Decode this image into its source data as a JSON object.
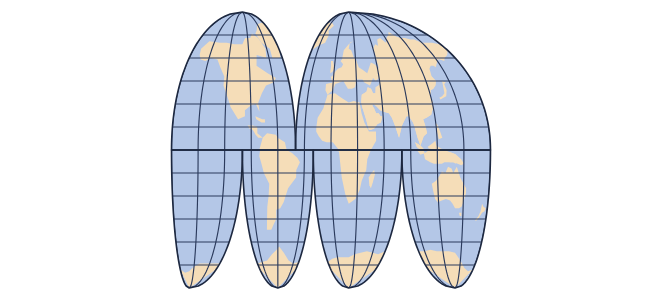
{
  "figure": {
    "type": "map",
    "projection": "interrupted-homolosine",
    "background_color": "#ffffff",
    "width": 662,
    "height": 299
  },
  "style": {
    "ocean_color": "#b4c7e7",
    "land_color": "#f5ddb8",
    "graticule_color": "#2b3a5c",
    "outline_color": "#1d2840",
    "graticule_width": 1.15,
    "outline_width": 1.6
  },
  "graticule": {
    "meridian_interval_deg": 30,
    "parallel_interval_deg": 15,
    "central_meridians": [
      -100,
      20,
      140
    ],
    "labels_visible": false
  },
  "lobes": [
    {
      "name": "north-americas-lobe",
      "hemisphere": "north",
      "central_meridian": -100,
      "lon_min": -180,
      "lon_max": -40,
      "lat_min": 0,
      "lat_max": 90
    },
    {
      "name": "north-eurasia-africa-lobe",
      "hemisphere": "north",
      "central_meridian": 20,
      "lon_min": -40,
      "lon_max": 180,
      "lat_min": 0,
      "lat_max": 90
    },
    {
      "name": "south-pacific-americas-lobe",
      "hemisphere": "south",
      "central_meridian": -160,
      "lon_min": -180,
      "lon_max": -100,
      "lat_min": -90,
      "lat_max": 0
    },
    {
      "name": "south-atlantic-americas-lobe",
      "hemisphere": "south",
      "central_meridian": -60,
      "lon_min": -100,
      "lon_max": -20,
      "lat_min": -90,
      "lat_max": 0
    },
    {
      "name": "south-africa-lobe",
      "hemisphere": "south",
      "central_meridian": 20,
      "lon_min": -20,
      "lon_max": 80,
      "lat_min": -90,
      "lat_max": 0
    },
    {
      "name": "south-australia-lobe",
      "hemisphere": "south",
      "central_meridian": 140,
      "lon_min": 80,
      "lon_max": 180,
      "lat_min": -90,
      "lat_max": 0
    }
  ],
  "landmasses": [
    {
      "name": "north-america",
      "lobe": "north-americas-lobe"
    },
    {
      "name": "greenland",
      "lobe": "north-americas-lobe"
    },
    {
      "name": "central-america",
      "lobe": "north-americas-lobe"
    },
    {
      "name": "caribbean",
      "lobe": "north-americas-lobe"
    },
    {
      "name": "south-america",
      "lobe": "south-atlantic-americas-lobe"
    },
    {
      "name": "africa",
      "lobe": "north-eurasia-africa-lobe"
    },
    {
      "name": "europe",
      "lobe": "north-eurasia-africa-lobe"
    },
    {
      "name": "asia",
      "lobe": "north-eurasia-africa-lobe"
    },
    {
      "name": "arabia",
      "lobe": "north-eurasia-africa-lobe"
    },
    {
      "name": "india",
      "lobe": "north-eurasia-africa-lobe"
    },
    {
      "name": "southeast-asia",
      "lobe": "north-eurasia-africa-lobe"
    },
    {
      "name": "indonesia",
      "lobe": "south-australia-lobe"
    },
    {
      "name": "australia",
      "lobe": "south-australia-lobe"
    },
    {
      "name": "new-zealand",
      "lobe": "south-australia-lobe"
    },
    {
      "name": "madagascar",
      "lobe": "south-africa-lobe"
    },
    {
      "name": "antarctica-pacific",
      "lobe": "south-pacific-americas-lobe"
    },
    {
      "name": "antarctica-atlantic",
      "lobe": "south-atlantic-americas-lobe"
    },
    {
      "name": "antarctica-africa",
      "lobe": "south-africa-lobe"
    },
    {
      "name": "antarctica-australia",
      "lobe": "south-australia-lobe"
    }
  ],
  "chart_data": {
    "type": "map",
    "projection": "Goode homolosine (interrupted)",
    "meridian_interval_deg": 30,
    "parallel_interval_deg": 15,
    "northern_lobe_count": 2,
    "southern_lobe_count": 4,
    "legend": [],
    "grid": true
  }
}
